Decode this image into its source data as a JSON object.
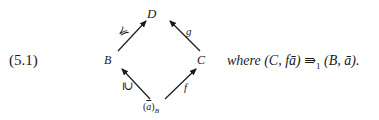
{
  "equation": {
    "number": "(5.1)"
  },
  "diagram": {
    "nodes": {
      "top": "D",
      "left": "B",
      "right": "C",
      "bottom_open": "(",
      "bottom_var": "a",
      "bottom_close": ")",
      "bottom_sub": "B"
    },
    "arrows": [
      {
        "from": "B",
        "to": "D",
        "label": "≼"
      },
      {
        "from": "C",
        "to": "D",
        "label": "g"
      },
      {
        "from": "(ā)_B",
        "to": "B",
        "label": "⊇"
      },
      {
        "from": "(ā)_B",
        "to": "C",
        "label": "f"
      }
    ],
    "labels": {
      "b_to_d": "≼",
      "c_to_d": "g",
      "ab_to_b": "⊇",
      "ab_to_c": "f"
    }
  },
  "caption": {
    "where": "where",
    "lhs": "(C, fā)",
    "arrow": "⇛",
    "arrow_sub": "1",
    "rhs": "(B, ā).",
    "full": "where (C, fā) ⇛₁ (B, ā)."
  }
}
